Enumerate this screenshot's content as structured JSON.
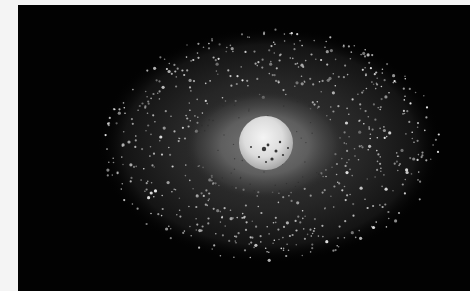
{
  "image": {
    "description": "Grayscale image of a bright spherical core surrounded by a soft glowing halo and a large elliptical cloud of many small bright speckles on a black background",
    "background_color": "#020202",
    "margin_color": "#f4f4f4",
    "core": {
      "cx": 248,
      "cy": 138,
      "r": 26,
      "color": "#e6e6e6",
      "dark_spots": 10
    },
    "halo": {
      "cx": 247,
      "cy": 140,
      "rx": 78,
      "ry": 52,
      "color": "#6a6a6a"
    },
    "cloud": {
      "cx": 252,
      "cy": 140,
      "rx": 170,
      "ry": 116,
      "speckle_color": "#bdbdbd",
      "speckle_count": 650
    }
  }
}
